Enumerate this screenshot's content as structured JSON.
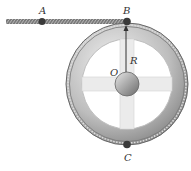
{
  "diagram": {
    "labels": {
      "A": "A",
      "B": "B",
      "C": "C",
      "O": "O",
      "R": "R"
    },
    "points": {
      "A": {
        "x": 42,
        "y": 22
      },
      "B": {
        "x": 127,
        "y": 22
      },
      "C": {
        "x": 127,
        "y": 145
      },
      "O": {
        "x": 127,
        "y": 84
      }
    },
    "wheel": {
      "outer_radius": 61,
      "inner_radius": 45,
      "hub_radius": 12
    },
    "colors": {
      "rope": "#6e6e6e",
      "rim_dark": "#7a7a7a",
      "rim_light": "#d9d9d9",
      "spokes": "#e6e6e6",
      "dots": "#3a3a3a"
    }
  }
}
